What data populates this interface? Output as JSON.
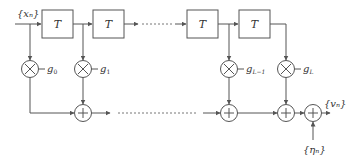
{
  "diagram": {
    "type": "tapped-delay-line FIR filter with additive noise",
    "input_label": "{xₙ}",
    "output_label": "{vₙ}",
    "noise_label": "{ηₙ}",
    "delay_label": "T",
    "delay_blocks": [
      "T",
      "T",
      "T",
      "T"
    ],
    "gains": [
      "g₀",
      "g₁",
      "g_L−1",
      "g_L"
    ],
    "gain_symbols": {
      "g0": "g",
      "g0_sub": "0",
      "g1": "g",
      "g1_sub": "1",
      "gL1": "g",
      "gL1_sub": "L−1",
      "gL": "g",
      "gL_sub": "L"
    },
    "multiplier_symbol": "×",
    "adder_symbol": "+"
  }
}
